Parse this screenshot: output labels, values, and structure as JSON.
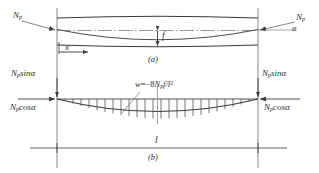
{
  "figure": {
    "caption_a": "(a)",
    "caption_b": "(b)",
    "force_symbol": "N",
    "force_subscript": "p",
    "angle_symbol": "α",
    "sag_label": "f",
    "span_label": "l",
    "axis_label": "x",
    "load_prefix": "w",
    "load_equals": "=−8",
    "load_mid": "f/",
    "load_exp": "2",
    "sin_text": "sinα",
    "cos_text": "cosα",
    "labels": {
      "force_top_left": "N",
      "force_top_right": "N",
      "vert_left": "sinα",
      "vert_right": "sinα",
      "horiz_left": "cosα",
      "horiz_right": "cosα"
    },
    "colors": {
      "line": "#3a3a3a",
      "thin": "#6b6b6b",
      "text": "#2e2e2e",
      "background": "#ffffff"
    }
  }
}
